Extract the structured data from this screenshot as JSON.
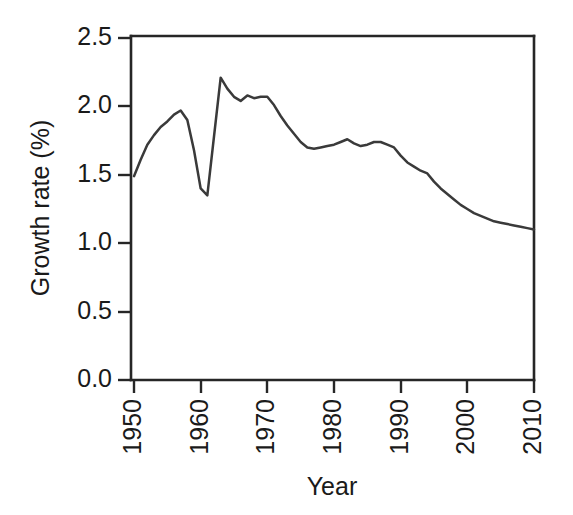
{
  "chart_data": {
    "type": "line",
    "title": "",
    "xlabel": "Year",
    "ylabel": "Growth rate (%)",
    "xlim": [
      1950,
      2010
    ],
    "ylim": [
      0.0,
      2.5
    ],
    "xticks": [
      1950,
      1960,
      1970,
      1980,
      1990,
      2000,
      2010
    ],
    "xtick_labels": [
      "1950",
      "1960",
      "1970",
      "1980",
      "1990",
      "2000",
      "2010"
    ],
    "xtick_label_rotation": -90,
    "yticks": [
      0.0,
      0.5,
      1.0,
      1.5,
      2.0,
      2.5
    ],
    "ytick_labels": [
      "0.0",
      "0.5",
      "1.0",
      "1.5",
      "2.0",
      "2.5"
    ],
    "grid": false,
    "legend": false,
    "legend_position": "none",
    "line_color": "#3a3a3a",
    "background_color": "#ffffff",
    "frame": [
      "left",
      "bottom",
      "top",
      "right"
    ],
    "x": [
      1950,
      1951,
      1952,
      1953,
      1954,
      1955,
      1956,
      1957,
      1958,
      1959,
      1960,
      1961,
      1962,
      1963,
      1964,
      1965,
      1966,
      1967,
      1968,
      1969,
      1970,
      1971,
      1972,
      1973,
      1974,
      1975,
      1976,
      1977,
      1978,
      1979,
      1980,
      1981,
      1982,
      1983,
      1984,
      1985,
      1986,
      1987,
      1988,
      1989,
      1990,
      1991,
      1992,
      1993,
      1994,
      1995,
      1996,
      1997,
      1998,
      1999,
      2000,
      2001,
      2002,
      2003,
      2004,
      2005,
      2006,
      2007,
      2008,
      2009,
      2010
    ],
    "y": [
      1.49,
      1.61,
      1.72,
      1.79,
      1.85,
      1.89,
      1.94,
      1.97,
      1.9,
      1.68,
      1.4,
      1.35,
      1.78,
      2.21,
      2.13,
      2.07,
      2.04,
      2.08,
      2.06,
      2.07,
      2.07,
      2.01,
      1.93,
      1.86,
      1.8,
      1.74,
      1.7,
      1.69,
      1.7,
      1.71,
      1.72,
      1.74,
      1.76,
      1.73,
      1.71,
      1.72,
      1.74,
      1.74,
      1.72,
      1.7,
      1.64,
      1.59,
      1.56,
      1.53,
      1.51,
      1.45,
      1.4,
      1.36,
      1.32,
      1.28,
      1.25,
      1.22,
      1.2,
      1.18,
      1.16,
      1.15,
      1.14,
      1.13,
      1.12,
      1.11,
      1.1
    ],
    "series_name": "Growth rate"
  },
  "axes": {
    "y_axis_title": "Growth rate (%)",
    "x_axis_title": "Year"
  }
}
